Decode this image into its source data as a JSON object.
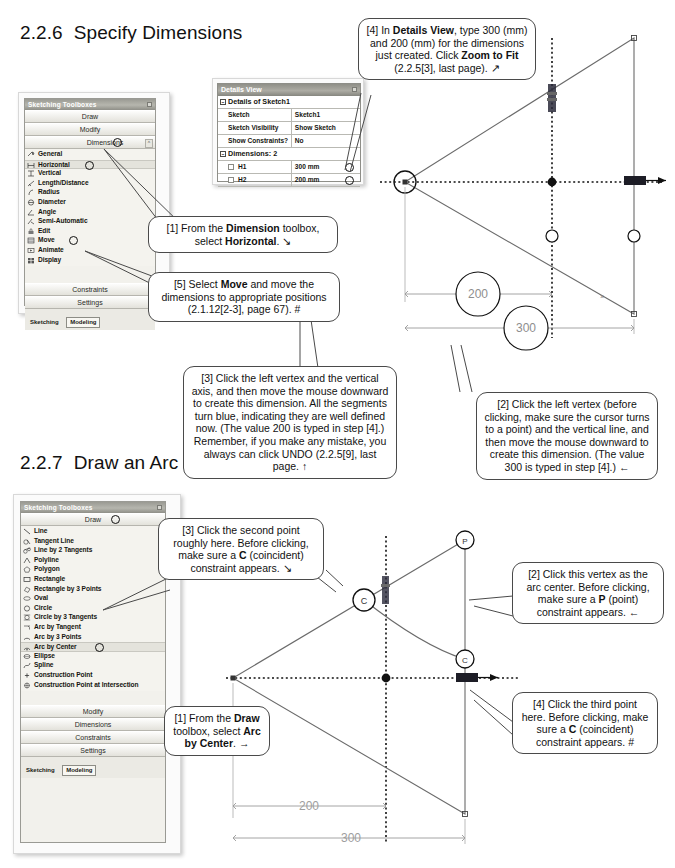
{
  "sections": [
    {
      "num": "2.2.6",
      "title": "Specify Dimensions"
    },
    {
      "num": "2.2.7",
      "title": "Draw an Arc"
    }
  ],
  "dimension_toolbox": {
    "title": "Sketching Toolboxes",
    "bars": [
      {
        "label": "Draw"
      },
      {
        "label": "Modify"
      },
      {
        "label": "Dimensions",
        "expanded": true
      }
    ],
    "items": [
      {
        "label": "General",
        "icon": "general-dimension-icon"
      },
      {
        "label": "Horizontal",
        "icon": "horizontal-dimension-icon",
        "highlighted": true
      },
      {
        "label": "Vertical",
        "icon": "vertical-dimension-icon"
      },
      {
        "label": "Length/Distance",
        "icon": "length-distance-icon"
      },
      {
        "label": "Radius",
        "icon": "radius-icon"
      },
      {
        "label": "Diameter",
        "icon": "diameter-icon"
      },
      {
        "label": "Angle",
        "icon": "angle-icon"
      },
      {
        "label": "Semi-Automatic",
        "icon": "semi-automatic-icon"
      },
      {
        "label": "Edit",
        "icon": "edit-icon"
      },
      {
        "label": "Move",
        "icon": "move-icon"
      },
      {
        "label": "Animate",
        "icon": "animate-icon"
      },
      {
        "label": "Display",
        "icon": "display-icon"
      }
    ],
    "footer_bars": [
      {
        "label": "Constraints"
      },
      {
        "label": "Settings"
      }
    ],
    "tabs": [
      {
        "label": "Sketching",
        "active": false
      },
      {
        "label": "Modeling",
        "active": true
      }
    ]
  },
  "draw_toolbox": {
    "title": "Sketching Toolboxes",
    "bars": [
      {
        "label": "Draw",
        "expanded": true
      }
    ],
    "items": [
      {
        "label": "Line",
        "icon": "line-icon"
      },
      {
        "label": "Tangent Line",
        "icon": "tangent-line-icon"
      },
      {
        "label": "Line by 2 Tangents",
        "icon": "line-by-2-tangents-icon"
      },
      {
        "label": "Polyline",
        "icon": "polyline-icon"
      },
      {
        "label": "Polygon",
        "icon": "polygon-icon"
      },
      {
        "label": "Rectangle",
        "icon": "rectangle-icon"
      },
      {
        "label": "Rectangle by 3 Points",
        "icon": "rectangle-by-3-points-icon"
      },
      {
        "label": "Oval",
        "icon": "oval-icon"
      },
      {
        "label": "Circle",
        "icon": "circle-icon"
      },
      {
        "label": "Circle by 3 Tangents",
        "icon": "circle-by-3-tangents-icon"
      },
      {
        "label": "Arc by Tangent",
        "icon": "arc-by-tangent-icon"
      },
      {
        "label": "Arc by 3 Points",
        "icon": "arc-by-3-points-icon"
      },
      {
        "label": "Arc by Center",
        "icon": "arc-by-center-icon",
        "highlighted": true
      },
      {
        "label": "Ellipse",
        "icon": "ellipse-icon"
      },
      {
        "label": "Spline",
        "icon": "spline-icon"
      },
      {
        "label": "Construction Point",
        "icon": "construction-point-icon"
      },
      {
        "label": "Construction Point at Intersection",
        "icon": "construction-point-intersection-icon"
      }
    ],
    "footer_bars": [
      {
        "label": "Modify"
      },
      {
        "label": "Dimensions"
      },
      {
        "label": "Constraints"
      },
      {
        "label": "Settings"
      }
    ],
    "tabs": [
      {
        "label": "Sketching",
        "active": false
      },
      {
        "label": "Modeling",
        "active": true
      }
    ]
  },
  "details_view": {
    "title": "Details View",
    "group_1": "Details of Sketch1",
    "rows": [
      {
        "name": "Sketch",
        "value": "Sketch1"
      },
      {
        "name": "Sketch Visibility",
        "value": "Show Sketch"
      },
      {
        "name": "Show Constraints?",
        "value": "No"
      }
    ],
    "group_2": "Dimensions: 2",
    "dimension_rows": [
      {
        "name": "H1",
        "value": "300 mm"
      },
      {
        "name": "H2",
        "value": "200 mm"
      }
    ]
  },
  "callouts": {
    "c1_dimension": {
      "html": "[1] From the <b>Dimension</b> toolbox, select <b>Horizontal</b>. \\",
      "plain": "[1] From the Dimension toolbox, select Horizontal."
    },
    "c5_move": {
      "plain": "[5] Select Move and move the dimensions to appropriate positions (2.1.12[2-3], page 67). #"
    },
    "c4_details": {
      "plain": "[4] In Details View, type 300 (mm) and 200 (mm) for the dimensions just created. Click Zoom to Fit (2.2.5[3], last page)."
    },
    "c3_left_vertex": {
      "plain": "[3] Click the left vertex and the vertical axis, and then move the mouse downward to create this dimension. All the segments turn blue, indicating they are well defined now. (The value 200 is typed in step [4].) Remember, if you make any mistake, you always can click UNDO (2.2.5[9], last page."
    },
    "c2_left_vertex": {
      "plain": "[2] Click the left vertex (before clicking, make sure the cursor turns to a point) and the vertical line, and then move the mouse downward to create this dimension. (The value 300 is typed in step [4].)"
    },
    "c3_second_point": {
      "plain": "[3] Click the second point roughly here. Before clicking, make sure a C (coincident) constraint appears."
    },
    "c1_draw": {
      "plain": "[1] From the Draw toolbox, select Arc by Center."
    },
    "c2_arc_center": {
      "plain": "[2] Click this vertex as the arc center. Before clicking, make sure a P (point) constraint appears."
    },
    "c4_third_point": {
      "plain": "[4] Click the third point here. Before clicking, make sure a C (coincident) constraint appears. #"
    }
  },
  "cad_top": {
    "dimensions": [
      {
        "label": "200"
      },
      {
        "label": "300"
      }
    ]
  },
  "cad_bottom": {
    "dimensions": [
      {
        "label": "200"
      },
      {
        "label": "300"
      }
    ]
  },
  "colors": {
    "panel_bg": "#f2f1ec",
    "title_bar": "#9a9a93",
    "sketch_line": "#6b6b6b",
    "dim_line": "#9a9a9a",
    "callout_border": "#4a4a4a"
  }
}
